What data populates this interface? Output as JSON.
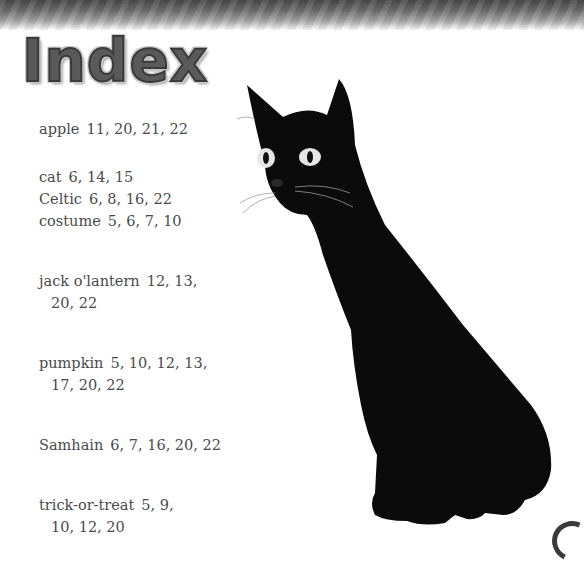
{
  "header": {
    "title": "Index"
  },
  "index": {
    "entries": [
      {
        "term": "apple",
        "pages": "11, 20, 21, 22"
      },
      {
        "term": "cat",
        "pages": "6, 14, 15"
      },
      {
        "term": "Celtic",
        "pages": "6, 8, 16, 22"
      },
      {
        "term": "costume",
        "pages": "5, 6, 7, 10"
      },
      {
        "term": "jack o'lantern",
        "pages": "12, 13, 20, 22"
      },
      {
        "term": "pumpkin",
        "pages": "5, 10, 12, 13, 17, 20, 22"
      },
      {
        "term": "Samhain",
        "pages": "6, 7, 16, 20, 22"
      },
      {
        "term": "trick-or-treat",
        "pages": "5, 9, 10, 12, 20"
      }
    ]
  },
  "illustration": {
    "subject": "black-cat",
    "eye_color": "#d8d8d8"
  }
}
